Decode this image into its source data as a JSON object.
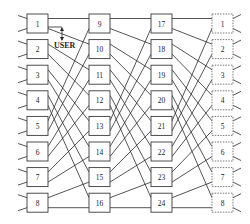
{
  "diagram": {
    "type": "omega-network",
    "stages": [
      {
        "name": "stage-1",
        "nodes": [
          "1",
          "2",
          "3",
          "4",
          "5",
          "6",
          "7",
          "8"
        ],
        "style": "solid"
      },
      {
        "name": "stage-2",
        "nodes": [
          "9",
          "10",
          "11",
          "12",
          "13",
          "14",
          "15",
          "16"
        ],
        "style": "solid"
      },
      {
        "name": "stage-3",
        "nodes": [
          "17",
          "18",
          "19",
          "20",
          "21",
          "22",
          "23",
          "24"
        ],
        "style": "solid"
      },
      {
        "name": "stage-4",
        "nodes": [
          "1",
          "2",
          "3",
          "4",
          "5",
          "6",
          "7",
          "8"
        ],
        "style": "dashed"
      }
    ],
    "interconnect": "perfect-shuffle",
    "annotation": {
      "text": "USER",
      "attached_to": "1",
      "icon": "double-arrow-vertical"
    },
    "colors": {
      "stroke": "#2a2a2a",
      "background": "#ffffff"
    }
  }
}
